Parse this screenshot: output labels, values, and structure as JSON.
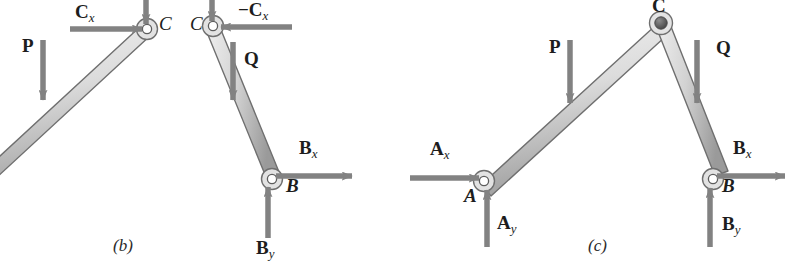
{
  "figure": {
    "background_color": "#ffffff",
    "member_fill_light": "#e9e9e9",
    "member_fill_dark": "#9a9a9a",
    "member_stroke": "#6e6e6e",
    "arrow_color": "#808080",
    "label_color": "#1d1d1d",
    "pin_open_fill": "#ffffff",
    "pin_closed_fill": "#5a5a5a"
  },
  "panels": [
    {
      "id": "panel-b",
      "caption": "(b)",
      "caption_x": 113,
      "caption_y": 237,
      "description": "Free-body diagrams of the two separated members AC and CB",
      "labels": [
        {
          "name": "force-cx-label",
          "text": "C",
          "sub": "x",
          "style": "bold",
          "x": 75,
          "y": 2
        },
        {
          "name": "force-p-label",
          "text": "P",
          "sub": "",
          "style": "bold",
          "x": 22,
          "y": 36
        },
        {
          "name": "point-c-left-label",
          "text": "C",
          "sub": "",
          "style": "italic",
          "x": 159,
          "y": 14
        },
        {
          "name": "point-c-right-label",
          "text": "C",
          "sub": "",
          "style": "italic",
          "x": 190,
          "y": 14
        },
        {
          "name": "force-neg-cx-label",
          "text": "−C",
          "sub": "x",
          "style": "bold",
          "x": 238,
          "y": 0
        },
        {
          "name": "force-q-label",
          "text": "Q",
          "sub": "",
          "style": "bold",
          "x": 244,
          "y": 49
        },
        {
          "name": "force-bx-label",
          "text": "B",
          "sub": "x",
          "style": "bold",
          "x": 299,
          "y": 138
        },
        {
          "name": "point-b-label",
          "text": "B",
          "sub": "",
          "style": "bolditalic",
          "x": 286,
          "y": 176
        },
        {
          "name": "force-by-label",
          "text": "B",
          "sub": "y",
          "style": "bold",
          "x": 256,
          "y": 238
        }
      ]
    },
    {
      "id": "panel-c",
      "caption": "(c)",
      "caption_x": 588,
      "caption_y": 237,
      "description": "Free-body diagram of the entire frame ACB",
      "labels": [
        {
          "name": "point-c-label",
          "text": "C",
          "sub": "",
          "style": "bold",
          "x": 652,
          "y": -4
        },
        {
          "name": "force-p-label",
          "text": "P",
          "sub": "",
          "style": "bold",
          "x": 549,
          "y": 37
        },
        {
          "name": "force-q-label",
          "text": "Q",
          "sub": "",
          "style": "bold",
          "x": 716,
          "y": 38
        },
        {
          "name": "force-ax-label",
          "text": "A",
          "sub": "x",
          "style": "bold",
          "x": 430,
          "y": 139
        },
        {
          "name": "point-a-label",
          "text": "A",
          "sub": "",
          "style": "bolditalic",
          "x": 464,
          "y": 186
        },
        {
          "name": "force-ay-label",
          "text": "A",
          "sub": "y",
          "style": "bold",
          "x": 497,
          "y": 213
        },
        {
          "name": "force-bx-label",
          "text": "B",
          "sub": "x",
          "style": "bold",
          "x": 733,
          "y": 138
        },
        {
          "name": "point-b-label",
          "text": "B",
          "sub": "",
          "style": "bolditalic",
          "x": 722,
          "y": 176
        },
        {
          "name": "force-by-label",
          "text": "B",
          "sub": "y",
          "style": "bold",
          "x": 722,
          "y": 214
        }
      ]
    }
  ]
}
